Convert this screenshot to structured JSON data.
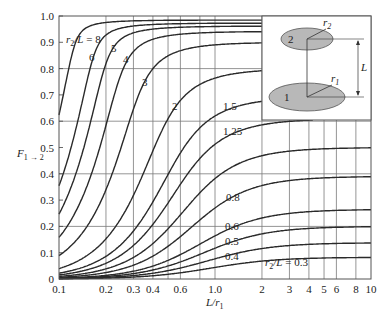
{
  "chart_data": {
    "type": "line",
    "title": "",
    "xlabel": "L/r1",
    "ylabel": "F1→2",
    "xscale": "log",
    "xlim": [
      0.1,
      10
    ],
    "ylim": [
      0,
      1.0
    ],
    "grid": true,
    "x_ticks": [
      0.1,
      0.2,
      0.3,
      0.4,
      0.6,
      1.0,
      2,
      3,
      4,
      5,
      6,
      8,
      10
    ],
    "x_tick_labels": [
      "0.1",
      "0.2",
      "0.3",
      "0.4",
      "0.6",
      "1.0",
      "2",
      "3",
      "4",
      "5",
      "6",
      "8",
      "10"
    ],
    "y_ticks": [
      0,
      0.1,
      0.2,
      0.3,
      0.4,
      0.5,
      0.6,
      0.7,
      0.8,
      0.9,
      1.0
    ],
    "y_tick_labels": [
      "0",
      "0.1",
      "0.2",
      "0.3",
      "0.4",
      "0.5",
      "0.6",
      "0.7",
      "0.8",
      "0.9",
      "1.0"
    ],
    "parameter": "r2/L",
    "series": [
      {
        "name": "r2/L = 8",
        "r2_over_L": 8,
        "label": "r2/L = 8"
      },
      {
        "name": "6",
        "r2_over_L": 6,
        "label": "6"
      },
      {
        "name": "5",
        "r2_over_L": 5,
        "label": "5"
      },
      {
        "name": "4",
        "r2_over_L": 4,
        "label": "4"
      },
      {
        "name": "3",
        "r2_over_L": 3,
        "label": "3"
      },
      {
        "name": "2",
        "r2_over_L": 2,
        "label": "2"
      },
      {
        "name": "1.5",
        "r2_over_L": 1.5,
        "label": "1.5"
      },
      {
        "name": "1.25",
        "r2_over_L": 1.25,
        "label": "1.25"
      },
      {
        "name": "1.0",
        "r2_over_L": 1.0,
        "label": "1.0"
      },
      {
        "name": "0.8",
        "r2_over_L": 0.8,
        "label": "0.8"
      },
      {
        "name": "0.6",
        "r2_over_L": 0.6,
        "label": "0.6"
      },
      {
        "name": "0.5",
        "r2_over_L": 0.5,
        "label": "0.5"
      },
      {
        "name": "0.4",
        "r2_over_L": 0.4,
        "label": "0.4"
      },
      {
        "name": "r2/L = 0.3",
        "r2_over_L": 0.3,
        "label": "r2/L = 0.3"
      }
    ],
    "sample_values": {
      "x": [
        0.1,
        0.2,
        0.4,
        1.0,
        2,
        4,
        10
      ],
      "r2/L=8": [
        0.62,
        0.86,
        0.95,
        0.98,
        0.98,
        0.98,
        0.98
      ],
      "r2/L=3": [
        0.08,
        0.27,
        0.6,
        0.86,
        0.89,
        0.9,
        0.9
      ],
      "r2/L=2": [
        0.04,
        0.14,
        0.38,
        0.7,
        0.77,
        0.79,
        0.8
      ],
      "r2/L=1.0": [
        0.01,
        0.04,
        0.13,
        0.38,
        0.46,
        0.49,
        0.5
      ],
      "r2/L=0.3": [
        0.0,
        0.0,
        0.01,
        0.05,
        0.07,
        0.08,
        0.08
      ]
    },
    "annotations": [
      {
        "text": "r2/L = 8",
        "position": "upper-left"
      },
      {
        "text": "r2/L = 0.3",
        "position": "lower-right"
      }
    ],
    "inset": {
      "description": "Coaxial parallel disks",
      "disk_top_label": "2",
      "disk_bottom_label": "1",
      "radius_top": "r2",
      "radius_bottom": "r1",
      "separation": "L"
    }
  }
}
